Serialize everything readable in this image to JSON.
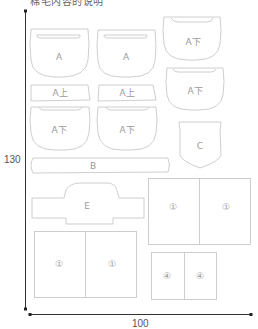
{
  "title": "棉毛内容的说明",
  "dimensions": {
    "height_label": "130",
    "width_label": "100"
  },
  "colors": {
    "outline": "#c8c8c8",
    "axis": "#333333",
    "label": "#9a9a9a"
  },
  "pieces": [
    {
      "id": "a-1",
      "label": "A"
    },
    {
      "id": "a-2",
      "label": "A"
    },
    {
      "id": "a-lower-1",
      "label": "A下"
    },
    {
      "id": "a-lower-2",
      "label": "A下"
    },
    {
      "id": "a-upper-1",
      "label": "A上"
    },
    {
      "id": "a-upper-2",
      "label": "A上"
    },
    {
      "id": "a-lower-3",
      "label": "A下"
    },
    {
      "id": "a-lower-4",
      "label": "A下"
    },
    {
      "id": "c",
      "label": "C"
    },
    {
      "id": "b",
      "label": "B"
    },
    {
      "id": "e",
      "label": "E"
    },
    {
      "id": "panel-1-right-a",
      "label": "①"
    },
    {
      "id": "panel-1-right-b",
      "label": "①"
    },
    {
      "id": "panel-1-left-a",
      "label": "①"
    },
    {
      "id": "panel-1-left-b",
      "label": "①"
    },
    {
      "id": "panel-4-a",
      "label": "④"
    },
    {
      "id": "panel-4-b",
      "label": "④"
    }
  ]
}
